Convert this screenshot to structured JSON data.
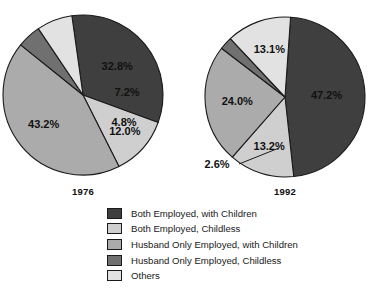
{
  "chart_data": {
    "type": "pie",
    "title": "",
    "subtitle": "",
    "xlabel": "",
    "ylabel": "",
    "grid": false,
    "legend_position": "bottom",
    "categories": [
      "Both Employed, with Children",
      "Both Employed, Childless",
      "Husband Only Employed, with Children",
      "Husband Only Employed, Childless",
      "Others"
    ],
    "category_colors": [
      "#3f3f3f",
      "#cfcfcf",
      "#ababab",
      "#707070",
      "#e2e2e2"
    ],
    "panels": [
      {
        "name": "1976",
        "label": "1976",
        "values": [
          32.8,
          12.0,
          43.2,
          4.8,
          7.2
        ],
        "labels": [
          "32.8%",
          "12.0%",
          "43.2%",
          "4.8%",
          "7.2%"
        ]
      },
      {
        "name": "1992",
        "label": "1992",
        "values": [
          47.2,
          13.2,
          24.0,
          2.6,
          13.1
        ],
        "labels": [
          "47.2%",
          "13.2%",
          "24.0%",
          "2.6%",
          "13.1%"
        ]
      }
    ]
  },
  "legend": {
    "items": [
      {
        "label": "Both Employed, with Children",
        "color": "#3f3f3f"
      },
      {
        "label": "Both Employed, Childless",
        "color": "#cfcfcf"
      },
      {
        "label": "Husband Only Employed, with Children",
        "color": "#ababab"
      },
      {
        "label": "Husband Only Employed, Childless",
        "color": "#707070"
      },
      {
        "label": "Others",
        "color": "#e2e2e2"
      }
    ]
  }
}
